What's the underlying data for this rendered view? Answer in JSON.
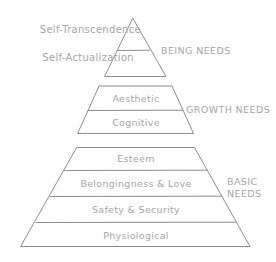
{
  "diagram": {
    "stroke_color": "#8d8d8d",
    "text_color": "#a6a6a6",
    "background_color": "#ffffff",
    "tiers": [
      {
        "id": "self-transcendence",
        "label": "Self-Transcendence",
        "placement": "left-outside",
        "group": "being-needs"
      },
      {
        "id": "self-actualization",
        "label": "Self-Actualization",
        "placement": "left-outside",
        "group": "being-needs"
      },
      {
        "id": "aesthetic",
        "label": "Aesthetic",
        "placement": "inside",
        "group": "growth-needs"
      },
      {
        "id": "cognitive",
        "label": "Cognitive",
        "placement": "inside",
        "group": "growth-needs"
      },
      {
        "id": "esteem",
        "label": "Esteem",
        "placement": "inside",
        "group": "basic-needs"
      },
      {
        "id": "belongingness-love",
        "label": "Belongingness & Love",
        "placement": "inside",
        "group": "basic-needs"
      },
      {
        "id": "safety-security",
        "label": "Safety & Security",
        "placement": "inside",
        "group": "basic-needs"
      },
      {
        "id": "physiological",
        "label": "Physiological",
        "placement": "inside",
        "group": "basic-needs"
      }
    ],
    "groups": [
      {
        "id": "being-needs",
        "label": "BEING NEEDS",
        "lines": [
          "BEING NEEDS"
        ]
      },
      {
        "id": "growth-needs",
        "label": "GROWTH NEEDS",
        "lines": [
          "GROWTH NEEDS"
        ]
      },
      {
        "id": "basic-needs",
        "label": "BASIC NEEDS",
        "lines": [
          "BASIC",
          "NEEDS"
        ]
      }
    ],
    "labels": {
      "self_transcendence": "Self-Transcendence",
      "self_actualization": "Self-Actualization",
      "aesthetic": "Aesthetic",
      "cognitive": "Cognitive",
      "esteem": "Esteem",
      "belongingness_love": "Belongingness & Love",
      "safety_security": "Safety & Security",
      "physiological": "Physiological",
      "being_needs": "BEING NEEDS",
      "growth_needs": "GROWTH NEEDS",
      "basic_needs_line1": "BASIC",
      "basic_needs_line2": "NEEDS"
    }
  }
}
